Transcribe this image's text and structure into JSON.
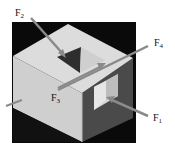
{
  "diagram": {
    "colors": {
      "background": "#ffffff",
      "frame": "#0a0a0a",
      "top_face": "#d9d9d9",
      "left_face": "#cfcfcf",
      "right_face": "#4a4a4a",
      "cutout_dark": "#2e2e2e",
      "arrow": "#8a8a8a"
    },
    "forces": [
      {
        "id": "F1",
        "label": "F",
        "subscript": "1"
      },
      {
        "id": "F2",
        "label": "F",
        "subscript": "2"
      },
      {
        "id": "F3",
        "label": "F",
        "subscript": "3"
      },
      {
        "id": "F4",
        "label": "F",
        "subscript": "4"
      }
    ]
  }
}
